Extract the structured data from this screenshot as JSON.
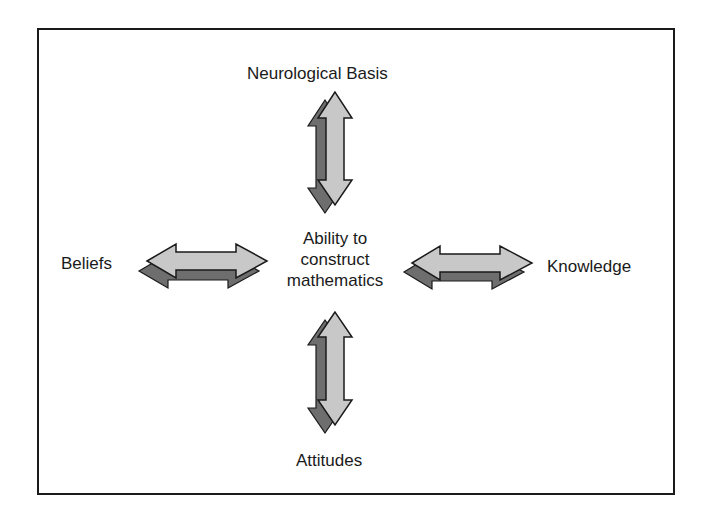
{
  "diagram": {
    "center": {
      "lines": [
        "Ability to",
        "construct",
        "mathematics"
      ]
    },
    "nodes": {
      "top": "Neurological Basis",
      "left": "Beliefs",
      "right": "Knowledge",
      "bottom": "Attitudes"
    },
    "connectors": [
      {
        "from": "center",
        "to": "Neurological Basis",
        "type": "double-arrow",
        "direction": "vertical"
      },
      {
        "from": "center",
        "to": "Beliefs",
        "type": "double-arrow",
        "direction": "horizontal"
      },
      {
        "from": "center",
        "to": "Knowledge",
        "type": "double-arrow",
        "direction": "horizontal"
      },
      {
        "from": "center",
        "to": "Attitudes",
        "type": "double-arrow",
        "direction": "vertical"
      }
    ],
    "colors": {
      "arrow_fill": "#c8c8c8",
      "arrow_shadow": "#6e6e6e",
      "stroke": "#1a1a1a",
      "text": "#1a1a1a",
      "background": "#ffffff"
    }
  }
}
